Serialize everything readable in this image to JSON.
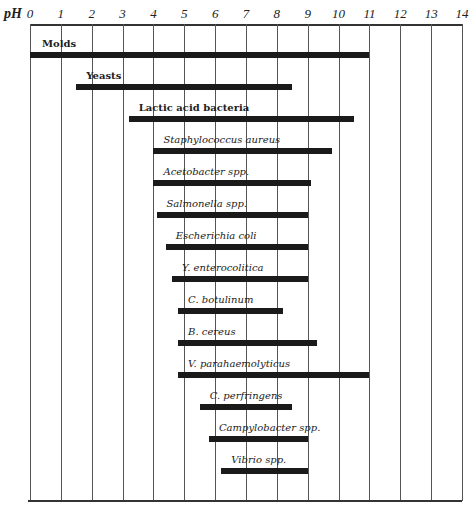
{
  "chart_data": {
    "type": "bar",
    "orientation": "horizontal-range",
    "title": "",
    "xlabel": "pH",
    "ylabel": "",
    "xlim": [
      0,
      14
    ],
    "x_ticks": [
      "0",
      "1",
      "2",
      "3",
      "4",
      "5",
      "6",
      "7",
      "8",
      "9",
      "10",
      "11",
      "12",
      "13",
      "14"
    ],
    "grid": true,
    "legend": null,
    "series": [
      {
        "name": "Molds",
        "italic": false,
        "min": 0.0,
        "max": 11.0
      },
      {
        "name": "Yeasts",
        "italic": false,
        "min": 1.5,
        "max": 8.5
      },
      {
        "name": "Lactic acid bacteria",
        "italic": false,
        "min": 3.2,
        "max": 10.5
      },
      {
        "name": "Staphylococcus aureus",
        "italic": true,
        "min": 4.0,
        "max": 9.8
      },
      {
        "name": "Acetobacter spp.",
        "italic": true,
        "min": 4.0,
        "max": 9.1
      },
      {
        "name": "Salmonella spp.",
        "italic": true,
        "min": 4.1,
        "max": 9.0
      },
      {
        "name": "Escherichia coli",
        "italic": true,
        "min": 4.4,
        "max": 9.0
      },
      {
        "name": "Y. enterocolitica",
        "italic": true,
        "min": 4.6,
        "max": 9.0
      },
      {
        "name": "C. botulinum",
        "italic": true,
        "min": 4.8,
        "max": 8.2
      },
      {
        "name": "B. cereus",
        "italic": true,
        "min": 4.8,
        "max": 9.3
      },
      {
        "name": "V. parahaemolyticus",
        "italic": true,
        "min": 4.8,
        "max": 11.0
      },
      {
        "name": "C. perfringens",
        "italic": true,
        "min": 5.5,
        "max": 8.5
      },
      {
        "name": "Campylobacter spp.",
        "italic": true,
        "min": 5.8,
        "max": 9.0
      },
      {
        "name": "Vibrio spp.",
        "italic": true,
        "min": 6.2,
        "max": 9.0
      }
    ]
  },
  "axis": {
    "label": "pH"
  },
  "colors": {
    "bar": "#1a1a1a",
    "grid": "#555555",
    "text": "#222222"
  }
}
